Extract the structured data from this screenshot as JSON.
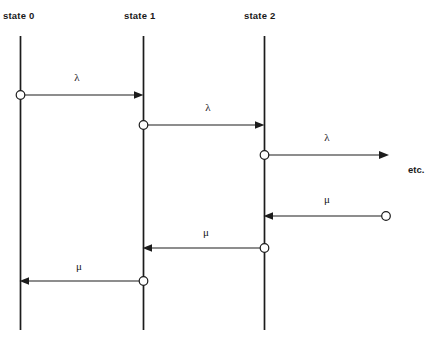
{
  "diagram": {
    "type": "birth-death-process-timeline",
    "background_color": "#ffffff",
    "line_color": "#1c1c1c",
    "text_color": "#1a1a1a",
    "width": 437,
    "height": 344,
    "states": [
      {
        "id": "state0",
        "label": "state  0",
        "label_x": 3,
        "label_y": 19,
        "line_x": 20.5,
        "line_top": 36,
        "line_bottom": 330
      },
      {
        "id": "state1",
        "label": "state  1",
        "label_x": 124,
        "label_y": 19,
        "line_x": 143.5,
        "line_top": 36,
        "line_bottom": 330
      },
      {
        "id": "state2",
        "label": "state  2",
        "label_x": 244,
        "label_y": 19,
        "line_x": 264.5,
        "line_top": 36,
        "line_bottom": 330
      }
    ],
    "transitions": [
      {
        "id": "t1",
        "label": "λ",
        "label_x": 77,
        "label_y": 81,
        "direction": "right",
        "from_x": 20.5,
        "to_x": 143.5,
        "y": 95,
        "dot_x": 20.5,
        "dot_y": 95,
        "meaning": "arrival from state 0 to state 1"
      },
      {
        "id": "t2",
        "label": "λ",
        "label_x": 208,
        "label_y": 111,
        "direction": "right",
        "from_x": 143.5,
        "to_x": 264.5,
        "y": 125,
        "dot_x": 143.5,
        "dot_y": 125,
        "meaning": "arrival from state 1 to state 2"
      },
      {
        "id": "t3",
        "label": "λ",
        "label_x": 327,
        "label_y": 141,
        "direction": "right",
        "from_x": 264.5,
        "to_x": 388,
        "y": 155,
        "dot_x": 264.5,
        "dot_y": 155,
        "meaning": "arrival from state 2 to state 3"
      },
      {
        "id": "t4",
        "label": "μ",
        "label_x": 327,
        "label_y": 203,
        "direction": "left",
        "from_x": 386,
        "to_x": 264.5,
        "y": 216,
        "dot_x": 386,
        "dot_y": 216,
        "meaning": "departure from state 3 back to state 2"
      },
      {
        "id": "t5",
        "label": "μ",
        "label_x": 206,
        "label_y": 236,
        "direction": "left",
        "from_x": 264.5,
        "to_x": 143.5,
        "y": 248,
        "dot_x": 264.5,
        "dot_y": 248,
        "meaning": "departure from state 2 back to state 1"
      },
      {
        "id": "t6",
        "label": "μ",
        "label_x": 79,
        "label_y": 270,
        "direction": "left",
        "from_x": 143.5,
        "to_x": 20.5,
        "y": 281,
        "dot_x": 143.5,
        "dot_y": 281,
        "meaning": "departure from state 1 back to state 0"
      }
    ],
    "annotations": [
      {
        "id": "etc",
        "label": "etc.",
        "x": 408,
        "y": 173
      }
    ]
  }
}
